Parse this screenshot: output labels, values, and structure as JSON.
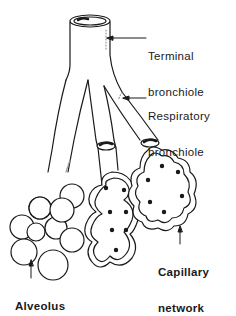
{
  "diagram": {
    "labels": {
      "terminal_bronchiole": {
        "line1": "Terminal",
        "line2": "bronchiole"
      },
      "respiratory_bronchiole": {
        "line1": "Respiratory",
        "line2": "bronchiole"
      },
      "capillary_network": {
        "line1": "Capillary",
        "line2": "network"
      },
      "alveolus": {
        "line1": "Alveolus"
      }
    },
    "colors": {
      "ink": "#1a1a1a",
      "background": "#ffffff",
      "shade": "#9a9a9a"
    }
  }
}
